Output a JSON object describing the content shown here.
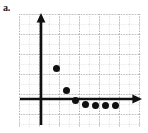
{
  "figure": {
    "panel_label": "a.",
    "background_color": "#ffffff",
    "ink_color": "#101010",
    "grid_color": "#b4b4b4"
  },
  "chart_data": {
    "type": "scatter",
    "title": "a.",
    "xlabel": "",
    "ylabel": "",
    "grid": true,
    "grid_minor_spacing": 10,
    "grid_major_spacing": 20,
    "legend": null,
    "axis_style": {
      "x_axis": "arrow-right",
      "y_axis": "arrow-up",
      "origin_x_px": 41,
      "origin_y_px": 99
    },
    "xlim": [
      -2.2,
      10.0
    ],
    "ylim": [
      -1.5,
      8.7
    ],
    "x": [
      1.5,
      2.5,
      3.4,
      4.4,
      5.4,
      6.4,
      7.4
    ],
    "y": [
      3.8,
      1.8,
      0.9,
      0.5,
      0.4,
      0.4,
      0.4
    ],
    "points": [
      {
        "x": 1.5,
        "y": 3.8
      },
      {
        "x": 2.5,
        "y": 1.8
      },
      {
        "x": 3.4,
        "y": 0.9
      },
      {
        "x": 4.4,
        "y": 0.5
      },
      {
        "x": 5.4,
        "y": 0.4
      },
      {
        "x": 6.4,
        "y": 0.4
      },
      {
        "x": 7.4,
        "y": 0.4
      }
    ],
    "xticks": [],
    "yticks": [],
    "annotations": []
  }
}
